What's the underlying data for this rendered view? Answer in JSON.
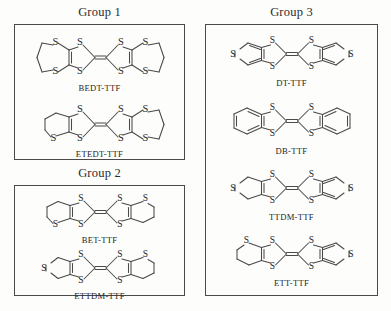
{
  "figure": {
    "background_color": "#fdfdfc",
    "line_color": "#4a4a4a",
    "text_color": "#242424"
  },
  "groups": [
    {
      "id": "group-1",
      "title": "Group 1",
      "molecules": [
        {
          "id": "bedt-ttf",
          "label": "BEDT-TTF",
          "skeleton": "ttf-core",
          "left_wing": "dithiine",
          "right_wing": "dithiine"
        },
        {
          "id": "etedt-ttf",
          "label": "ETEDT-TTF",
          "skeleton": "ttf-core",
          "left_wing": "dithiolane-5",
          "right_wing": "dithiine"
        }
      ]
    },
    {
      "id": "group-2",
      "title": "Group 2",
      "molecules": [
        {
          "id": "bet-ttf",
          "label": "BET-TTF",
          "skeleton": "ttf-core",
          "left_wing": "dithiolane-5",
          "right_wing": "dithiolane-5"
        },
        {
          "id": "ettdm-ttf",
          "label": "ETTDM-TTF",
          "skeleton": "ttf-core",
          "left_wing": "thiophene",
          "right_wing": "dithiolane-5"
        }
      ]
    },
    {
      "id": "group-3",
      "title": "Group 3",
      "molecules": [
        {
          "id": "dt-ttf",
          "label": "DT-TTF",
          "skeleton": "ttf-core",
          "left_wing": "thiophene",
          "right_wing": "thiophene"
        },
        {
          "id": "db-ttf",
          "label": "DB-TTF",
          "skeleton": "ttf-core",
          "left_wing": "benzene",
          "right_wing": "benzene"
        },
        {
          "id": "ttdm-ttf",
          "label": "TTDM-TTF",
          "skeleton": "ttf-core",
          "left_wing": "thiophene-sat",
          "right_wing": "thiophene"
        },
        {
          "id": "ett-ttf",
          "label": "ETT-TTF",
          "skeleton": "ttf-core",
          "left_wing": "dithiolane-5",
          "right_wing": "thiophene"
        }
      ]
    }
  ],
  "atom_label": "S"
}
